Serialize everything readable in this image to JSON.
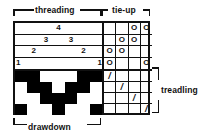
{
  "labels": {
    "threading": "threading",
    "tieup": "tie-up",
    "drawdown": "drawdown",
    "treadling": "treadling"
  },
  "marks": {
    "tieup_mark": "O",
    "treadling_mark": "/",
    "empty": ""
  },
  "chart_data": {
    "type": "table",
    "threading": {
      "label": "threading",
      "shafts": 4,
      "ends": 7,
      "shaft_row_labels": [
        "4",
        "3",
        "2",
        "1"
      ],
      "sequence": [
        1,
        2,
        3,
        4,
        3,
        2,
        1
      ],
      "rows": [
        [
          "",
          "",
          "",
          "4",
          "",
          "",
          ""
        ],
        [
          "",
          "",
          "3",
          "",
          "3",
          "",
          ""
        ],
        [
          "",
          "2",
          "",
          "",
          "",
          "2",
          ""
        ],
        [
          "1",
          "",
          "",
          "",
          "",
          "",
          "1"
        ]
      ]
    },
    "tieup": {
      "label": "tie-up",
      "rows": 4,
      "cols": 4,
      "row_order": [
        "shaft 4",
        "shaft 3",
        "shaft 2",
        "shaft 1"
      ],
      "col_order": [
        "treadle 1",
        "treadle 2",
        "treadle 3",
        "treadle 4"
      ],
      "cells": [
        [
          0,
          0,
          1,
          1
        ],
        [
          0,
          1,
          1,
          0
        ],
        [
          1,
          1,
          0,
          0
        ],
        [
          1,
          0,
          0,
          1
        ]
      ]
    },
    "treadling": {
      "label": "treadling",
      "rows": 4,
      "cols": 4,
      "sequence": [
        1,
        2,
        3,
        4
      ],
      "cells": [
        [
          1,
          0,
          0,
          0
        ],
        [
          0,
          1,
          0,
          0
        ],
        [
          0,
          0,
          1,
          0
        ],
        [
          0,
          0,
          0,
          1
        ]
      ]
    },
    "drawdown": {
      "label": "drawdown",
      "rows": 4,
      "cols": 7,
      "legend": {
        "1": "warp up (black)",
        "0": "weft up (white)"
      },
      "cells": [
        [
          1,
          1,
          0,
          0,
          0,
          1,
          1
        ],
        [
          0,
          1,
          1,
          0,
          1,
          1,
          0
        ],
        [
          0,
          0,
          1,
          1,
          1,
          0,
          0
        ],
        [
          1,
          0,
          0,
          1,
          0,
          0,
          1
        ]
      ]
    },
    "colors": {
      "ink": "#111111",
      "warp_up": "#000000",
      "weft_up": "#ffffff",
      "background": "#ffffff"
    }
  }
}
